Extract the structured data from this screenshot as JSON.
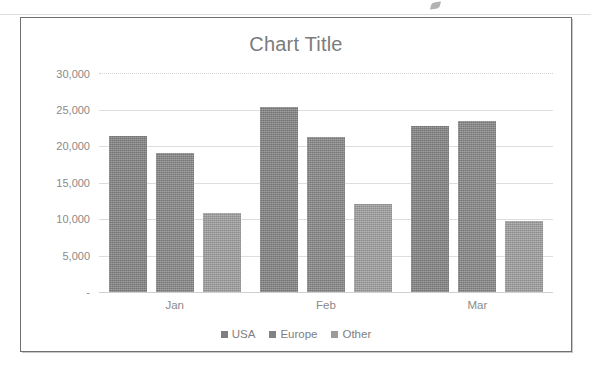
{
  "chart_data": {
    "type": "bar",
    "title": "Chart Title",
    "xlabel": "",
    "ylabel": "",
    "categories": [
      "Jan",
      "Feb",
      "Mar"
    ],
    "series": [
      {
        "name": "USA",
        "values": [
          21400,
          25300,
          22700
        ],
        "color": "#7e7e7e"
      },
      {
        "name": "Europe",
        "values": [
          19000,
          21200,
          23400
        ],
        "color": "#828282"
      },
      {
        "name": "Other",
        "values": [
          10800,
          12100,
          9700
        ],
        "color": "#9a9a9a"
      }
    ],
    "ylim": [
      0,
      30000
    ],
    "ytick_values": [
      30000,
      25000,
      20000,
      15000,
      10000,
      5000,
      0
    ],
    "ytick_labels": [
      "30,000",
      "25,000",
      "20,000",
      "15,000",
      "10,000",
      "5,000",
      "-"
    ],
    "grid": true,
    "legend_position": "bottom",
    "grouping": "clustered"
  },
  "legend": {
    "items": [
      {
        "label": "USA"
      },
      {
        "label": "Europe"
      },
      {
        "label": "Other"
      }
    ]
  },
  "colors": {
    "series_usa": "#7e7e7e",
    "series_europe": "#828282",
    "series_other": "#9a9a9a",
    "gridline": "#dedede",
    "text": "#8a8a8a",
    "title_text": "#7b7b7b",
    "frame_border": "#6f6f6f",
    "background": "#ffffff"
  }
}
